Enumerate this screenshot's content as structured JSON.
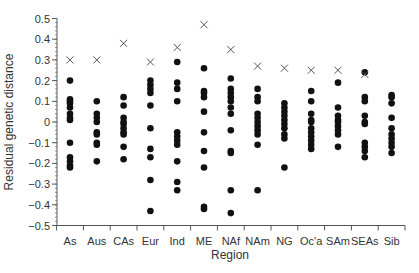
{
  "chart_data": {
    "type": "scatter",
    "title": "",
    "xlabel": "Region",
    "ylabel": "Residual genetic distance",
    "ylim": [
      -0.5,
      0.5
    ],
    "yticks": [
      0.5,
      0.4,
      0.3,
      0.2,
      0.1,
      0,
      -0.1,
      -0.2,
      -0.3,
      -0.4,
      -0.5
    ],
    "ytick_labels": [
      "0.5",
      "0.4",
      "0.3",
      "0.2",
      "0.1",
      "0",
      "−0.1",
      "−0.2",
      "−0.3",
      "−0.4",
      "−0.5"
    ],
    "grid": false,
    "legend": null,
    "categories": [
      "As",
      "Aus",
      "CAs",
      "Eur",
      "Ind",
      "ME",
      "NAf",
      "NAm",
      "NG",
      "Oc'a",
      "SAm",
      "SEAs",
      "Sib"
    ],
    "series": [
      {
        "name": "population residuals",
        "marker": "filled-circle",
        "values": [
          [
            0.2,
            0.11,
            0.1,
            0.09,
            0.07,
            0.04,
            0.02,
            0.01,
            -0.1,
            -0.17,
            -0.19,
            -0.21,
            -0.22
          ],
          [
            0.1,
            0.04,
            0.02,
            0.0,
            -0.05,
            -0.06,
            -0.1,
            -0.11,
            -0.19
          ],
          [
            0.12,
            0.08,
            0.02,
            0.0,
            -0.01,
            -0.03,
            -0.05,
            -0.06,
            -0.12,
            -0.18
          ],
          [
            0.2,
            0.18,
            0.16,
            0.14,
            0.08,
            -0.03,
            -0.13,
            -0.17,
            -0.28,
            -0.43
          ],
          [
            0.29,
            0.19,
            0.16,
            0.1,
            -0.05,
            -0.07,
            -0.09,
            -0.11,
            -0.19,
            -0.29,
            -0.33
          ],
          [
            0.26,
            0.15,
            0.14,
            0.12,
            0.05,
            -0.05,
            -0.14,
            -0.22,
            -0.41,
            -0.42
          ],
          [
            0.21,
            0.16,
            0.14,
            0.12,
            0.1,
            0.07,
            0.04,
            -0.04,
            -0.14,
            -0.15,
            -0.33,
            -0.44
          ],
          [
            0.16,
            0.12,
            0.1,
            0.04,
            0.02,
            0.0,
            -0.02,
            -0.04,
            -0.06,
            -0.11,
            -0.33
          ],
          [
            0.09,
            0.07,
            0.05,
            0.03,
            0.01,
            -0.01,
            -0.03,
            -0.06,
            -0.08,
            -0.22
          ],
          [
            0.15,
            0.1,
            0.04,
            0.01,
            0.0,
            -0.03,
            -0.05,
            -0.07,
            -0.09,
            -0.11,
            -0.13
          ],
          [
            0.19,
            0.07,
            0.03,
            0.01,
            0.0,
            -0.02,
            -0.04,
            -0.06,
            -0.12
          ],
          [
            0.24,
            0.12,
            0.1,
            0.03,
            0.0,
            -0.01,
            -0.1,
            -0.12,
            -0.14,
            -0.17
          ],
          [
            0.13,
            0.12,
            0.09,
            0.02,
            -0.03,
            -0.06,
            -0.08,
            -0.1,
            -0.12,
            -0.15
          ]
        ]
      },
      {
        "name": "region marker",
        "marker": "x",
        "values": [
          0.3,
          0.3,
          0.38,
          0.29,
          0.36,
          0.47,
          0.35,
          0.27,
          0.26,
          0.25,
          0.25,
          0.23,
          null
        ]
      }
    ]
  },
  "colors": {
    "axis": "#555555",
    "points": "#111111",
    "cross": "#555555",
    "text": "#333333"
  }
}
